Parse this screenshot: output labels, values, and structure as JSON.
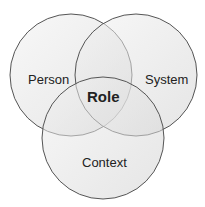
{
  "diagram": {
    "type": "venn",
    "circles": [
      {
        "label": "Person",
        "cx": 71,
        "cy": 75,
        "r": 61
      },
      {
        "label": "System",
        "cx": 136,
        "cy": 75,
        "r": 61
      },
      {
        "label": "Context",
        "cx": 103,
        "cy": 138,
        "r": 61
      }
    ],
    "center_label": "Role",
    "colors": {
      "fill": "#d9d9d9",
      "stroke": "#555555"
    }
  }
}
